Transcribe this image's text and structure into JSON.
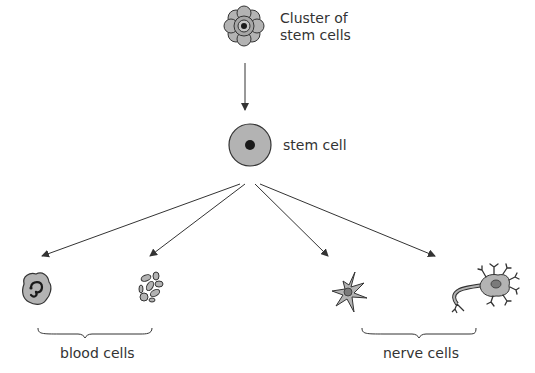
{
  "diagram": {
    "colors": {
      "cell_fill": "#b3b3b3",
      "cell_stroke": "#333333",
      "nucleus": "#1a1a1a",
      "arrow": "#333333",
      "text": "#333333"
    },
    "nodes": {
      "cluster": {
        "label_line1": "Cluster of",
        "label_line2": "stem cells",
        "icon": "stem-cell-cluster-icon"
      },
      "stem_cell": {
        "label": "stem cell",
        "icon": "stem-cell-icon"
      },
      "outputs": [
        {
          "name": "white-blood-cell",
          "icon": "white-blood-cell-icon",
          "group": "blood"
        },
        {
          "name": "platelets",
          "icon": "platelets-icon",
          "group": "blood"
        },
        {
          "name": "glial-cell",
          "icon": "glial-cell-icon",
          "group": "nerve"
        },
        {
          "name": "neuron",
          "icon": "neuron-icon",
          "group": "nerve"
        }
      ]
    },
    "groups": {
      "blood": {
        "label": "blood cells"
      },
      "nerve": {
        "label": "nerve cells"
      }
    },
    "edges": [
      {
        "from": "cluster",
        "to": "stem_cell"
      },
      {
        "from": "stem_cell",
        "to": "white-blood-cell"
      },
      {
        "from": "stem_cell",
        "to": "platelets"
      },
      {
        "from": "stem_cell",
        "to": "glial-cell"
      },
      {
        "from": "stem_cell",
        "to": "neuron"
      }
    ]
  }
}
